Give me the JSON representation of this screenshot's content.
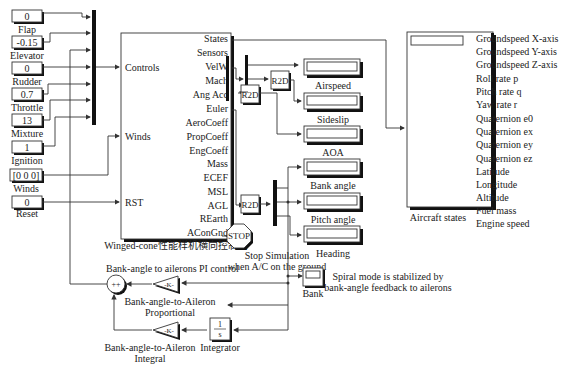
{
  "constants": [
    {
      "value": "0",
      "label": "Flap"
    },
    {
      "value": "-0.15",
      "label": "Elevator"
    },
    {
      "value": "0",
      "label": "Rudder"
    },
    {
      "value": "0.7",
      "label": "Throttle"
    },
    {
      "value": "13",
      "label": "Mixture"
    },
    {
      "value": "1",
      "label": "Ignition"
    },
    {
      "value": "[0 0 0]",
      "label": "Winds"
    },
    {
      "value": "0",
      "label": "Reset"
    }
  ],
  "main_block": {
    "title": "Winged-cone性能样机横向控制器",
    "inputs": [
      "Controls",
      "Winds",
      "RST"
    ],
    "outputs": [
      "States",
      "Sensors",
      "VelW",
      "Mach",
      "Ang Acc",
      "Euler",
      "AeroCoeff",
      "PropCoeff",
      "EngCoeff",
      "Mass",
      "ECEF",
      "MSL",
      "AGL",
      "REarth",
      "AConGnd"
    ]
  },
  "r2d_blocks": [
    "R2D",
    "R2D",
    "R2D"
  ],
  "displays": [
    {
      "label": "Airspeed"
    },
    {
      "label": "Sideslip"
    },
    {
      "label": "AOA"
    },
    {
      "label": "Bank angle"
    },
    {
      "label": "Pitch angle"
    },
    {
      "label": "Heading"
    }
  ],
  "stop_block": {
    "text": "STOP",
    "caption_line1": "Stop Simulation",
    "caption_line2": "when A/C on the ground"
  },
  "aircraft_states": {
    "label": "Aircraft states",
    "signals": [
      "Groundspeed X-axis",
      "Groundspeed Y-axis",
      "Groundspeed Z-axis",
      "Roll rate p",
      "Pitch rate q",
      "Yaw rate r",
      "Quaternion e0",
      "Quaternion ex",
      "Quaternion ey",
      "Quaternion ez",
      "Latitude",
      "Longitude",
      "Altitude",
      "Fuel mass",
      "Engine speed"
    ]
  },
  "control": {
    "title": "Bank-angle to ailerons PI control",
    "sum_signs": "++",
    "gain_symbol": "-K-",
    "proportional_line1": "Bank-angle-to-Aileron",
    "proportional_line2": "Proportional",
    "integral_line1": "Bank-angle-to-Aileron",
    "integral_line2": "Integral",
    "integrator_num": "1",
    "integrator_den": "s",
    "integrator_label": "Integrator"
  },
  "scope": {
    "label": "Bank"
  },
  "note": {
    "line1": "Spiral mode is stabilized by",
    "line2": "bank-angle feedback to ailerons"
  }
}
